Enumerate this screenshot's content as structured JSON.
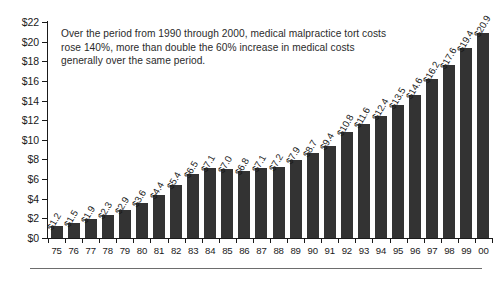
{
  "chart_data": {
    "type": "bar",
    "title": "",
    "subtitle": "",
    "xlabel": "",
    "ylabel": "",
    "ylim": [
      0,
      22
    ],
    "grid": false,
    "legend": "none",
    "y_tick_labels": [
      "$0",
      "$2",
      "$4",
      "$6",
      "$8",
      "$10",
      "$12",
      "$14",
      "$16",
      "$18",
      "$20",
      "$22"
    ],
    "y_tick_values": [
      0,
      2,
      4,
      6,
      8,
      10,
      12,
      14,
      16,
      18,
      20,
      22
    ],
    "categories": [
      "75",
      "76",
      "77",
      "78",
      "79",
      "80",
      "81",
      "82",
      "83",
      "84",
      "85",
      "86",
      "87",
      "88",
      "89",
      "90",
      "91",
      "92",
      "93",
      "94",
      "95",
      "96",
      "97",
      "98",
      "99",
      "00"
    ],
    "values": [
      1.2,
      1.5,
      1.9,
      2.3,
      2.9,
      3.6,
      4.4,
      5.4,
      6.5,
      7.1,
      7.0,
      6.8,
      7.1,
      7.2,
      7.9,
      8.7,
      9.4,
      10.8,
      11.6,
      12.4,
      13.5,
      14.6,
      16.2,
      17.6,
      19.4,
      20.9
    ],
    "value_labels": [
      "$1.2",
      "$1.5",
      "$1.9",
      "$2.3",
      "$2.9",
      "$3.6",
      "$4.4",
      "$5.4",
      "$6.5",
      "$7.1",
      "$7.0",
      "$6.8",
      "$7.1",
      "$7.2",
      "$7.9",
      "$8.7",
      "$9.4",
      "$10.8",
      "$11.6",
      "$12.4",
      "$13.5",
      "$14.6",
      "$16.2",
      "$17.6",
      "$19.4",
      "$20.9"
    ],
    "annotations": [
      {
        "name": "callout-text",
        "text": "Over the period from 1990 through 2000, medical malpractice tort costs rose 140%, more than double the 60% increase in medical costs generally over the same period."
      }
    ],
    "colors": {
      "bar": "#333333",
      "axis": "#1a1a1a",
      "text": "#1a1a1a",
      "annotation_text": "#2b2b2b",
      "rule": "#6d6d6d",
      "background": "#ffffff"
    }
  }
}
